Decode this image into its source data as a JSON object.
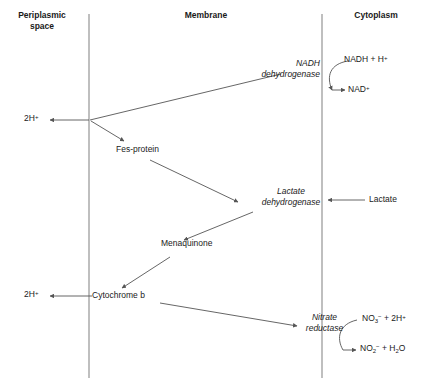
{
  "diagram": {
    "line_color": "#555555",
    "text_color": "#1a1a1a",
    "compartments": [
      {
        "id": "periplasmic-space",
        "label": "Periplasmic\nspace"
      },
      {
        "id": "membrane",
        "label": "Membrane"
      },
      {
        "id": "cytoplasm",
        "label": "Cytoplasm"
      }
    ],
    "membrane_boundaries": [
      {
        "id": "left-membrane-line",
        "x": 89
      },
      {
        "id": "right-membrane-line",
        "x": 322
      }
    ],
    "enzymes": [
      {
        "id": "nadh-dehydrogenase",
        "label": "NADH\ndehydrogenase",
        "style": "italic"
      },
      {
        "id": "lactate-dehydrogenase",
        "label": "Lactate\ndehydrogenase",
        "style": "italic"
      },
      {
        "id": "nitrate-reductase",
        "label": "Nitrate\nreductase",
        "style": "italic"
      }
    ],
    "carriers": [
      {
        "id": "fes-protein",
        "label": "Fes-protein"
      },
      {
        "id": "menaquinone",
        "label": "Menaquinone"
      },
      {
        "id": "cytochrome-b",
        "label": "Cytochrome b"
      }
    ],
    "proton_labels": [
      {
        "id": "proton-exit-upper",
        "label": "2H+",
        "html": "2H<sup>+</sup>"
      },
      {
        "id": "proton-exit-lower",
        "label": "2H+",
        "html": "2H<sup>+</sup>"
      }
    ],
    "substrates": [
      {
        "id": "nadh-h",
        "label": "NADH + H+",
        "html": "NADH + H<sup>+</sup>"
      },
      {
        "id": "nad-plus",
        "label": "NAD+",
        "html": "NAD<sup>+</sup>"
      },
      {
        "id": "lactate",
        "label": "Lactate",
        "html": "Lactate"
      },
      {
        "id": "nitrate",
        "label": "NO3- + 2H+",
        "html": "NO<sub>3</sub><sup>&#8722;</sup> + 2H<sup>+</sup>"
      },
      {
        "id": "nitrite-water",
        "label": "NO2- + H2O",
        "html": "NO<sub>2</sub><sup>&#8722;</sup> + H<sub>2</sub>O"
      }
    ]
  }
}
